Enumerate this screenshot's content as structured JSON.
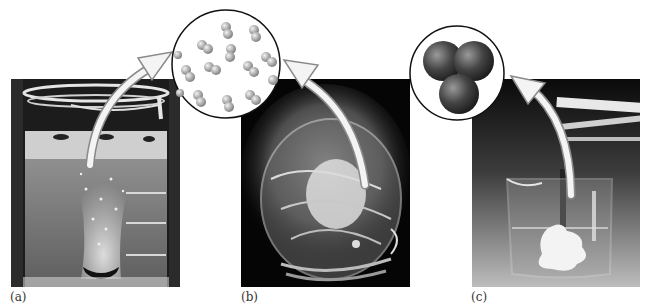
{
  "figure": {
    "panels": [
      {
        "id": "a",
        "label": "(a)",
        "photo": "beaker-with-gas-bubbles",
        "inset": "gas-molecules-diatomic",
        "colors": {
          "background": "#2a2a2a",
          "liquid": "#7a7a7a",
          "bubbles": "#e8e8e8"
        }
      },
      {
        "id": "b",
        "label": "(b)",
        "photo": "beaker-with-vapor-fumes",
        "inset": "gas-molecules-diatomic",
        "colors": {
          "background": "#050505",
          "vapor": "#d8d8d8"
        }
      },
      {
        "id": "c",
        "label": "(c)",
        "photo": "beaker-with-white-precipitate",
        "inset": "three-atom-cluster",
        "colors": {
          "background_top": "#0a0a0a",
          "background_bottom": "#b5b5b5",
          "precipitate": "#f2f2f2"
        }
      }
    ],
    "accent": {
      "arrow": "#f4f4f4",
      "arrow_outline": "#8a8a8a",
      "inset_border": "#111111"
    }
  }
}
